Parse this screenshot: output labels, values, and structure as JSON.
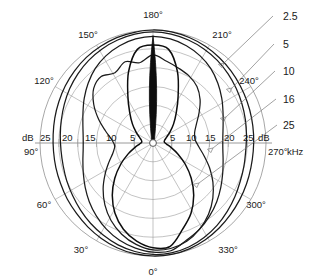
{
  "chart_data": {
    "type": "line",
    "subtype": "polar-directivity",
    "title": "",
    "xlabel": "",
    "ylabel": "",
    "radial_unit": "dB",
    "angular_unit": "degrees",
    "legend_unit": "kHz",
    "legend_position": "right",
    "grid": true,
    "center": {
      "x": 153,
      "y": 143
    },
    "outer_radius_px": 113,
    "radial_axis": {
      "label_left": "dB",
      "label_right": "dB",
      "ticks": [
        25,
        20,
        15,
        10,
        5
      ],
      "ticks_right": [
        5,
        10,
        15,
        20,
        25
      ],
      "rings_db": [
        5,
        10,
        15,
        20,
        25
      ],
      "max_db": 30,
      "direction": "inward-decreasing"
    },
    "angular_axis": {
      "labels": [
        "0°",
        "30°",
        "60°",
        "90°",
        "120°",
        "150°",
        "180°",
        "210°",
        "240°",
        "270°",
        "300°",
        "330°"
      ],
      "step_deg": 30,
      "zero_at": "bottom"
    },
    "legend_entries": [
      {
        "label": "2.5",
        "unit": "kHz"
      },
      {
        "label": "5",
        "unit": "kHz"
      },
      {
        "label": "10",
        "unit": "kHz"
      },
      {
        "label": "16",
        "unit": "kHz"
      },
      {
        "label": "25",
        "unit": "kHz"
      }
    ],
    "series": [
      {
        "name": "2.5",
        "unit": "kHz",
        "description": "widest, near-omnidirectional outermost trace",
        "values_db": [
          30,
          29.8,
          29.4,
          28.8,
          28.2,
          27.6,
          27.2,
          26.8,
          26.6,
          26.5,
          26.6,
          26.9,
          27.3,
          27.8,
          28.3,
          28.8,
          29.2,
          29.6,
          29.8,
          30,
          29.9,
          29.6,
          29.2,
          28.7,
          28.2,
          27.7,
          27.3,
          27.0,
          26.8,
          26.7,
          26.8,
          27.1,
          27.5,
          28.0,
          28.6,
          29.2,
          29.7,
          30
        ]
      },
      {
        "name": "5",
        "unit": "kHz",
        "description": "second widest trace, slightly inside 2.5 kHz",
        "values_db": [
          29.6,
          29.2,
          28.6,
          27.8,
          27.0,
          26.2,
          25.5,
          25.0,
          24.6,
          24.5,
          24.7,
          25.1,
          25.7,
          26.4,
          27.1,
          27.8,
          28.4,
          28.9,
          29.3,
          29.5,
          29.3,
          28.9,
          28.4,
          27.8,
          27.1,
          26.4,
          25.8,
          25.3,
          24.9,
          24.7,
          24.9,
          25.3,
          26.0,
          26.8,
          27.7,
          28.5,
          29.2,
          29.6
        ]
      },
      {
        "name": "10",
        "unit": "kHz",
        "description": "mid-width cardioid-like trace",
        "values_db": [
          29.0,
          28.3,
          27.3,
          26.0,
          24.5,
          23.0,
          21.5,
          20.2,
          19.2,
          18.6,
          18.6,
          19.2,
          20.3,
          21.8,
          23.4,
          25.0,
          26.3,
          27.3,
          28.0,
          28.3,
          28.0,
          27.3,
          26.3,
          25.0,
          23.4,
          21.8,
          20.3,
          19.2,
          18.6,
          18.6,
          19.2,
          20.2,
          21.5,
          23.0,
          24.5,
          26.0,
          27.3,
          29.0
        ]
      },
      {
        "name": "16",
        "unit": "kHz",
        "description": "narrow lower lobe with irregular stepped side lobes in upper-left quadrant",
        "values_db": [
          28.4,
          27.3,
          25.6,
          23.4,
          20.8,
          18.0,
          15.2,
          12.8,
          11.0,
          10.2,
          11.0,
          13.0,
          15.8,
          18.8,
          21.4,
          22.4,
          21.2,
          22.8,
          21.6,
          23.4,
          22.0,
          21.0,
          20.2,
          19.0,
          17.0,
          14.6,
          12.6,
          11.4,
          11.2,
          12.2,
          14.0,
          16.4,
          19.0,
          21.6,
          24.0,
          26.0,
          27.6,
          28.4
        ]
      },
      {
        "name": "25",
        "unit": "kHz",
        "description": "highly directional narrow beam pointing at 180 degrees, rendered as a thick dark spike",
        "values_db": [
          27.8,
          26.4,
          24.2,
          21.2,
          17.6,
          13.8,
          10.2,
          7.2,
          5.0,
          3.6,
          3.0,
          3.2,
          4.0,
          5.4,
          7.4,
          10.0,
          14.0,
          20.0,
          25.2,
          26.0,
          25.2,
          20.0,
          14.0,
          10.0,
          7.4,
          5.4,
          4.0,
          3.2,
          3.0,
          3.6,
          5.0,
          7.2,
          10.2,
          13.8,
          17.6,
          21.2,
          24.2,
          27.8
        ]
      }
    ]
  },
  "axis_text": {
    "db_left": "dB",
    "db_right": "dB",
    "khz": "kHz",
    "left_ticks": [
      "25",
      "20",
      "15",
      "10",
      "5"
    ],
    "right_ticks": [
      "5",
      "10",
      "15",
      "20",
      "25"
    ]
  },
  "angles": {
    "a0": "0°",
    "a30": "30°",
    "a60": "60°",
    "a90": "90°",
    "a120": "120°",
    "a150": "150°",
    "a180": "180°",
    "a210": "210°",
    "a240": "240°",
    "a270": "270°",
    "a300": "300°",
    "a330": "330°"
  },
  "legend": {
    "f1": "2.5",
    "f2": "5",
    "f3": "10",
    "f4": "16",
    "f5": "25",
    "unit": "kHz"
  },
  "colors": {
    "background": "#ffffff",
    "grid": "#9a9a9a",
    "trace": "#1b1b1b",
    "text": "#1a1a1a",
    "leader": "#6f6f6f"
  }
}
